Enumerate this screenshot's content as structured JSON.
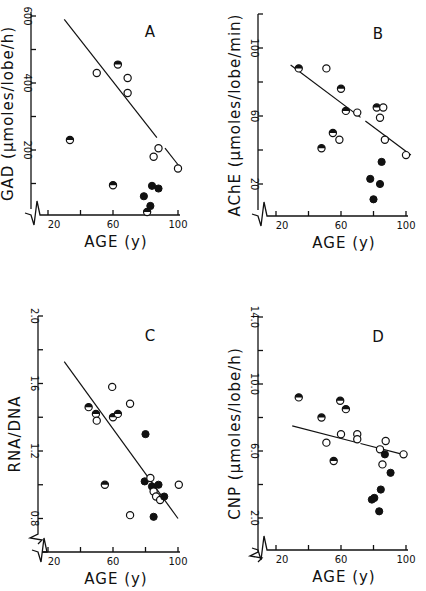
{
  "chart_data": [
    {
      "panel": "A",
      "type": "scatter",
      "title": "",
      "panel_label": "A",
      "xlabel": "AGE (y)",
      "ylabel": "GAD (µmoles/lobe/h)",
      "xlim": [
        15,
        105
      ],
      "ylim": [
        0,
        600
      ],
      "xticks": [
        20,
        40,
        60,
        80,
        100
      ],
      "xtick_labels": [
        "20",
        "",
        "60",
        "",
        "100"
      ],
      "yticks": [
        100,
        200,
        300,
        400,
        500,
        600
      ],
      "ytick_labels": [
        "",
        "200",
        "",
        "400",
        "",
        "600"
      ],
      "axis_break": true,
      "grid": false,
      "layout": {
        "x0": 31,
        "xAxisY": 215,
        "ageX20": 48,
        "pxPerYear": 1.625,
        "yZero": 217,
        "pxPerUnit": 0.335,
        "yTopPx": 12,
        "xEndPx": 180
      },
      "regression_line": {
        "x": [
          30,
          101
        ],
        "y": [
          590,
          150
        ],
        "gap": [
          87,
          92
        ]
      },
      "points": [
        {
          "age": 33.5,
          "value": 230,
          "style": "half"
        },
        {
          "age": 50,
          "value": 430,
          "style": "open"
        },
        {
          "age": 63,
          "value": 455,
          "style": "half"
        },
        {
          "age": 69,
          "value": 415,
          "style": "open"
        },
        {
          "age": 69,
          "value": 370,
          "style": "open"
        },
        {
          "age": 88,
          "value": 205,
          "style": "open"
        },
        {
          "age": 85,
          "value": 180,
          "style": "open"
        },
        {
          "age": 100,
          "value": 145,
          "style": "open"
        },
        {
          "age": 60,
          "value": 95,
          "style": "half"
        },
        {
          "age": 84,
          "value": 93,
          "style": "filled"
        },
        {
          "age": 88,
          "value": 85,
          "style": "filled"
        },
        {
          "age": 79,
          "value": 62,
          "style": "filled"
        },
        {
          "age": 83,
          "value": 33,
          "style": "filled"
        },
        {
          "age": 81,
          "value": 15,
          "style": "half"
        }
      ]
    },
    {
      "panel": "B",
      "type": "scatter",
      "title": "",
      "panel_label": "B",
      "xlabel": "AGE (y)",
      "ylabel": "AChE (µmoles/lobe/min)",
      "xlim": [
        15,
        105
      ],
      "ylim": [
        0,
        120
      ],
      "xticks": [
        20,
        40,
        60,
        80,
        100
      ],
      "xtick_labels": [
        "20",
        "",
        "60",
        "",
        "100"
      ],
      "yticks": [
        20,
        40,
        60,
        80,
        100,
        120
      ],
      "ytick_labels": [
        "20",
        "",
        "60",
        "",
        "100",
        ""
      ],
      "axis_break": true,
      "grid": false,
      "layout": {
        "x0": 258,
        "xAxisY": 216,
        "ageX20": 276,
        "pxPerYear": 1.625,
        "yZero": 218,
        "pxPerUnit": 1.7,
        "yTopPx": 14,
        "xEndPx": 408
      },
      "regression_line": {
        "x": [
          29,
          103
        ],
        "y": [
          90,
          37
        ],
        "gap": [
          72,
          75
        ]
      },
      "points": [
        {
          "age": 34,
          "value": 88,
          "style": "half"
        },
        {
          "age": 51,
          "value": 88,
          "style": "open"
        },
        {
          "age": 60,
          "value": 76,
          "style": "half"
        },
        {
          "age": 63,
          "value": 63,
          "style": "half"
        },
        {
          "age": 70,
          "value": 62,
          "style": "open"
        },
        {
          "age": 55,
          "value": 50,
          "style": "half"
        },
        {
          "age": 59,
          "value": 46,
          "style": "open"
        },
        {
          "age": 48,
          "value": 41,
          "style": "half"
        },
        {
          "age": 82,
          "value": 65,
          "style": "half"
        },
        {
          "age": 86,
          "value": 65,
          "style": "open"
        },
        {
          "age": 84,
          "value": 59,
          "style": "open"
        },
        {
          "age": 87,
          "value": 46,
          "style": "open"
        },
        {
          "age": 100,
          "value": 37,
          "style": "open"
        },
        {
          "age": 85,
          "value": 33,
          "style": "filled"
        },
        {
          "age": 78,
          "value": 23,
          "style": "filled"
        },
        {
          "age": 84,
          "value": 20,
          "style": "filled"
        },
        {
          "age": 80,
          "value": 11,
          "style": "filled"
        }
      ]
    },
    {
      "panel": "C",
      "type": "scatter",
      "title": "",
      "panel_label": "C",
      "xlabel": "AGE (y)",
      "ylabel": "RNA/DNA",
      "xlim": [
        15,
        105
      ],
      "ylim": [
        0.8,
        2.0
      ],
      "xticks": [
        20,
        40,
        60,
        80,
        100
      ],
      "xtick_labels": [
        "20",
        "",
        "60",
        "",
        "100"
      ],
      "yticks": [
        0.8,
        1.0,
        1.2,
        1.4,
        1.6,
        1.8,
        2.0
      ],
      "ytick_labels": [
        "0.8",
        "",
        "1.2",
        "",
        "1.6",
        "",
        "2.0"
      ],
      "axis_break": true,
      "grid": false,
      "layout": {
        "x0": 38,
        "xAxisY": 552,
        "ageX20": 48,
        "pxPerYear": 1.625,
        "yRefVal": 2.0,
        "yRefPx": 316,
        "pxPerUnit": 168.75,
        "yBottomPx": 530,
        "xEndPx": 180
      },
      "regression_line": {
        "x": [
          30,
          100
        ],
        "y": [
          1.73,
          0.8
        ]
      },
      "points": [
        {
          "age": 45,
          "value": 1.46,
          "style": "half"
        },
        {
          "age": 49.5,
          "value": 1.42,
          "style": "half"
        },
        {
          "age": 50,
          "value": 1.38,
          "style": "open"
        },
        {
          "age": 59.5,
          "value": 1.58,
          "style": "open"
        },
        {
          "age": 60,
          "value": 1.4,
          "style": "half"
        },
        {
          "age": 63,
          "value": 1.42,
          "style": "half"
        },
        {
          "age": 70.5,
          "value": 1.48,
          "style": "open"
        },
        {
          "age": 80,
          "value": 1.3,
          "style": "filled"
        },
        {
          "age": 55,
          "value": 1.0,
          "style": "half"
        },
        {
          "age": 70.5,
          "value": 0.82,
          "style": "open"
        },
        {
          "age": 79.5,
          "value": 1.02,
          "style": "filled"
        },
        {
          "age": 83,
          "value": 1.04,
          "style": "open"
        },
        {
          "age": 84,
          "value": 0.99,
          "style": "filled"
        },
        {
          "age": 88,
          "value": 1.0,
          "style": "filled"
        },
        {
          "age": 85,
          "value": 0.96,
          "style": "open"
        },
        {
          "age": 86.5,
          "value": 0.93,
          "style": "open"
        },
        {
          "age": 89,
          "value": 0.91,
          "style": "open"
        },
        {
          "age": 91.5,
          "value": 0.93,
          "style": "filled"
        },
        {
          "age": 85,
          "value": 0.81,
          "style": "filled"
        },
        {
          "age": 100.5,
          "value": 1.0,
          "style": "open"
        }
      ]
    },
    {
      "panel": "D",
      "type": "scatter",
      "title": "",
      "panel_label": "D",
      "xlabel": "AGE (y)",
      "ylabel": "CNP (µmoles/lobe/h)",
      "xlim": [
        15,
        105
      ],
      "ylim": [
        0,
        14.0
      ],
      "xticks": [
        20,
        40,
        60,
        80,
        100
      ],
      "xtick_labels": [
        "20",
        "",
        "60",
        "",
        "100"
      ],
      "yticks": [
        2.0,
        4.0,
        6.0,
        8.0,
        10.0,
        12.0,
        14.0
      ],
      "ytick_labels": [
        "2.0",
        "",
        "6.0",
        "",
        "10.0",
        "",
        "14.0"
      ],
      "axis_break": true,
      "grid": false,
      "layout": {
        "x0": 258,
        "xAxisY": 550,
        "ageX20": 276,
        "pxPerYear": 1.625,
        "yRefVal": 14.0,
        "yRefPx": 317,
        "pxPerUnit": 16.75,
        "yBottomPx": 548,
        "xEndPx": 408
      },
      "regression_line": {
        "x": [
          30,
          98
        ],
        "y": [
          7.5,
          5.8
        ],
        "gap": [
          69,
          72
        ]
      },
      "points": [
        {
          "age": 34,
          "value": 9.2,
          "style": "half"
        },
        {
          "age": 59.5,
          "value": 9.0,
          "style": "half"
        },
        {
          "age": 63,
          "value": 8.5,
          "style": "half"
        },
        {
          "age": 48,
          "value": 8.0,
          "style": "half"
        },
        {
          "age": 51,
          "value": 6.5,
          "style": "open"
        },
        {
          "age": 60,
          "value": 7.0,
          "style": "open"
        },
        {
          "age": 70,
          "value": 7.0,
          "style": "open"
        },
        {
          "age": 70,
          "value": 6.7,
          "style": "open"
        },
        {
          "age": 87.5,
          "value": 6.6,
          "style": "open"
        },
        {
          "age": 84,
          "value": 6.1,
          "style": "open"
        },
        {
          "age": 98.5,
          "value": 5.8,
          "style": "open"
        },
        {
          "age": 55.5,
          "value": 5.4,
          "style": "half"
        },
        {
          "age": 87,
          "value": 5.8,
          "style": "filled"
        },
        {
          "age": 85.5,
          "value": 5.2,
          "style": "open"
        },
        {
          "age": 90.5,
          "value": 4.7,
          "style": "filled"
        },
        {
          "age": 84.5,
          "value": 3.7,
          "style": "filled"
        },
        {
          "age": 79,
          "value": 3.1,
          "style": "filled"
        },
        {
          "age": 80.5,
          "value": 3.2,
          "style": "filled"
        },
        {
          "age": 83.5,
          "value": 2.4,
          "style": "filled"
        }
      ]
    }
  ]
}
